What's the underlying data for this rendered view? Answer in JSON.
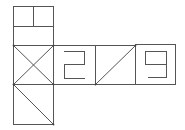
{
  "diagram": {
    "type": "cube-net",
    "stroke_color": "#555555",
    "background": "#ffffff",
    "faces": [
      {
        "id": "top",
        "pattern": "two-small-squares-over-rectangle",
        "x": 13,
        "y": 6,
        "size": 39
      },
      {
        "id": "middle-left",
        "pattern": "x-cross",
        "x": 13,
        "y": 45,
        "size": 40
      },
      {
        "id": "middle-2",
        "pattern": "digit",
        "symbol": "2",
        "x": 53,
        "y": 45,
        "size": 42
      },
      {
        "id": "middle-3",
        "pattern": "diagonal-bottom-left-to-top-right",
        "x": 95,
        "y": 45,
        "size": 40
      },
      {
        "id": "middle-9",
        "pattern": "digit",
        "symbol": "9",
        "x": 135,
        "y": 45,
        "size": 40
      },
      {
        "id": "bottom",
        "pattern": "diagonal-top-left-to-bottom-right",
        "x": 13,
        "y": 84,
        "size": 40
      }
    ]
  }
}
